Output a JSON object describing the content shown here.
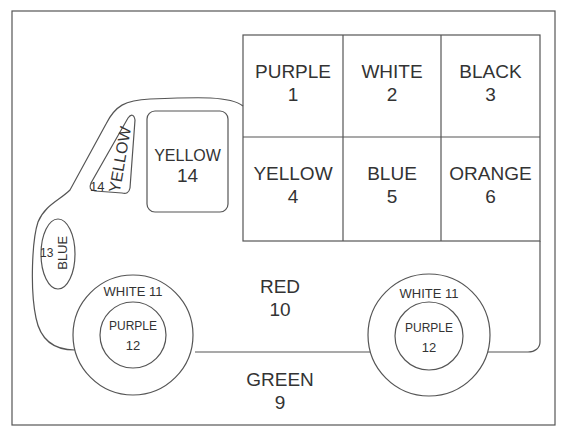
{
  "page": {
    "type": "color-by-number worksheet"
  },
  "cargo_grid": [
    {
      "color": "PURPLE",
      "number": "1"
    },
    {
      "color": "WHITE",
      "number": "2"
    },
    {
      "color": "BLACK",
      "number": "3"
    },
    {
      "color": "YELLOW",
      "number": "4"
    },
    {
      "color": "BLUE",
      "number": "5"
    },
    {
      "color": "ORANGE",
      "number": "6"
    }
  ],
  "body": {
    "color": "RED",
    "number": "10"
  },
  "ground": {
    "color": "GREEN",
    "number": "9"
  },
  "front_window": {
    "color": "YELLOW",
    "number": "14"
  },
  "side_window": {
    "color": "YELLOW",
    "number": "14"
  },
  "headlight": {
    "color": "BLUE",
    "number": "13"
  },
  "wheels": [
    {
      "tire": "WHITE 11",
      "hub_color": "PURPLE",
      "hub_number": "12"
    },
    {
      "tire": "WHITE 11",
      "hub_color": "PURPLE",
      "hub_number": "12"
    }
  ]
}
